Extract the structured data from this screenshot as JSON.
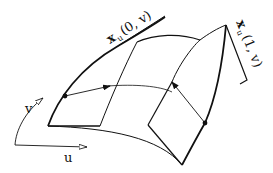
{
  "diagram": {
    "labels": {
      "tangent_left": {
        "base": "x",
        "sub": "u",
        "args": "(0, v)"
      },
      "tangent_right": {
        "base": "x",
        "sub": "u",
        "args": "(1, v)"
      },
      "axis_v": "v",
      "axis_u": "u"
    },
    "colors": {
      "stroke": "#111111",
      "background": "#ffffff"
    }
  }
}
